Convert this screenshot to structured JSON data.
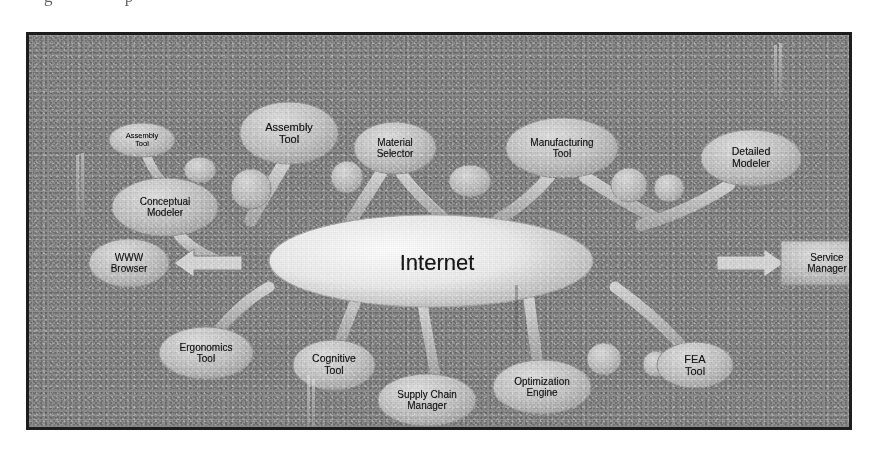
{
  "figure": {
    "artifact_text": "g p",
    "background_color": "#8c8c8c",
    "frame_color": "#1d1d1d",
    "node_fill": "#c9c9c9",
    "hub_fill": "#f2f2f2",
    "connector_color": "#d7d7d7"
  },
  "hub": {
    "label": "Internet",
    "shape": "ellipse"
  },
  "nodes": [
    {
      "id": "assembly-tool-small",
      "label": "Assembly\nTool",
      "shape": "ellipse",
      "cx": 113,
      "cy": 105,
      "rx": 33,
      "ry": 17,
      "font_size": 7.5
    },
    {
      "id": "assembly-tool",
      "label": "Assembly\nTool",
      "shape": "ellipse",
      "cx": 260,
      "cy": 98,
      "rx": 49,
      "ry": 31,
      "font_size": 11
    },
    {
      "id": "conceptual-modeler",
      "label": "Conceptual\nModeler",
      "shape": "ellipse",
      "cx": 136,
      "cy": 172,
      "rx": 53,
      "ry": 29,
      "font_size": 10
    },
    {
      "id": "material-selector",
      "label": "Material\nSelector",
      "shape": "ellipse",
      "cx": 366,
      "cy": 113,
      "rx": 41,
      "ry": 26,
      "font_size": 10
    },
    {
      "id": "manufacturing-tool",
      "label": "Manufacturing\nTool",
      "shape": "ellipse",
      "cx": 533,
      "cy": 113,
      "rx": 56,
      "ry": 30,
      "font_size": 10
    },
    {
      "id": "detailed-modeler",
      "label": "Detailed\nModeler",
      "shape": "ellipse",
      "cx": 722,
      "cy": 123,
      "rx": 50,
      "ry": 28,
      "font_size": 10.5
    },
    {
      "id": "www-browser",
      "label": "WWW\nBrowser",
      "shape": "ellipse",
      "cx": 100,
      "cy": 228,
      "rx": 40,
      "ry": 24,
      "font_size": 10
    },
    {
      "id": "service-manager",
      "label": "Service\nManager",
      "shape": "rectangle",
      "cx": 798,
      "cy": 228,
      "rx": 46,
      "ry": 22,
      "font_size": 10
    },
    {
      "id": "ergonomics-tool",
      "label": "Ergonomics\nTool",
      "shape": "ellipse",
      "cx": 177,
      "cy": 318,
      "rx": 47,
      "ry": 26,
      "font_size": 10
    },
    {
      "id": "cognitive-tool",
      "label": "Cognitive\nTool",
      "shape": "ellipse",
      "cx": 305,
      "cy": 330,
      "rx": 41,
      "ry": 25,
      "font_size": 10.5
    },
    {
      "id": "supply-chain-manager",
      "label": "Supply Chain\nManager",
      "shape": "ellipse",
      "cx": 398,
      "cy": 365,
      "rx": 49,
      "ry": 26,
      "font_size": 10
    },
    {
      "id": "optimization-engine",
      "label": "Optimization\nEngine",
      "shape": "ellipse",
      "cx": 513,
      "cy": 352,
      "rx": 49,
      "ry": 27,
      "font_size": 10
    },
    {
      "id": "fea-tool",
      "label": "FEA\nTool",
      "shape": "ellipse",
      "cx": 666,
      "cy": 330,
      "rx": 38,
      "ry": 23,
      "font_size": 11
    }
  ],
  "connector_blobs": [
    {
      "cx": 222,
      "cy": 154,
      "rx": 20,
      "ry": 20
    },
    {
      "cx": 318,
      "cy": 142,
      "rx": 16,
      "ry": 16
    },
    {
      "cx": 441,
      "cy": 146,
      "rx": 21,
      "ry": 16
    },
    {
      "cx": 600,
      "cy": 150,
      "rx": 18,
      "ry": 17
    },
    {
      "cx": 640,
      "cy": 153,
      "rx": 15,
      "ry": 14
    },
    {
      "cx": 575,
      "cy": 324,
      "rx": 17,
      "ry": 16
    },
    {
      "cx": 627,
      "cy": 329,
      "rx": 13,
      "ry": 13
    },
    {
      "cx": 171,
      "cy": 135,
      "rx": 16,
      "ry": 13
    }
  ],
  "arrows": [
    {
      "id": "arrow-to-www-browser",
      "direction": "left",
      "from_x": 215,
      "to_x": 148,
      "y": 228
    },
    {
      "id": "arrow-to-service-manager",
      "direction": "right",
      "from_x": 690,
      "to_x": 750,
      "y": 228
    }
  ],
  "scan_streaks": [
    {
      "x": 47,
      "y": 120,
      "h": 60
    },
    {
      "x": 52,
      "y": 118,
      "h": 64
    },
    {
      "x": 745,
      "y": 10,
      "h": 52
    },
    {
      "x": 750,
      "y": 8,
      "h": 56
    },
    {
      "x": 278,
      "y": 340,
      "h": 52
    },
    {
      "x": 283,
      "y": 344,
      "h": 48
    },
    {
      "x": 486,
      "y": 250,
      "h": 58
    }
  ]
}
